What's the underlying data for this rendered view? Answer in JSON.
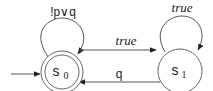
{
  "diagram": {
    "type": "automaton",
    "states": [
      {
        "id": "s0",
        "label": "s",
        "subscript": "0",
        "initial": true,
        "accepting": true
      },
      {
        "id": "s1",
        "label": "s",
        "subscript": "1",
        "initial": false,
        "accepting": false
      }
    ],
    "transitions": [
      {
        "from": "s0",
        "to": "s0",
        "label": "!p∨q"
      },
      {
        "from": "s0",
        "to": "s1",
        "label": "true"
      },
      {
        "from": "s1",
        "to": "s1",
        "label": "true"
      },
      {
        "from": "s1",
        "to": "s0",
        "label": "q"
      }
    ]
  },
  "colors": {
    "stroke": "#555555",
    "text": "#222222",
    "background": "#ffffff"
  }
}
